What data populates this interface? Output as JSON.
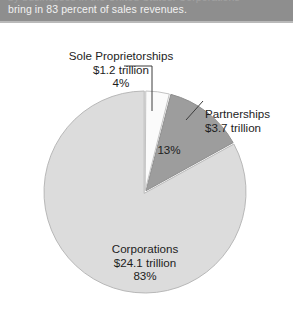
{
  "band": {
    "faint_line": "by businesses in the United States. Corporations",
    "main_line": "bring in 83 percent of sales revenues."
  },
  "chart_data": {
    "type": "pie",
    "title": "",
    "categories": [
      "Sole Proprietorships",
      "Partnerships",
      "Corporations"
    ],
    "values": [
      4,
      13,
      83
    ],
    "value_labels": [
      "$1.2 trillion",
      "$3.7 trillion",
      "$24.1 trillion"
    ],
    "percent_labels": [
      "4%",
      "13%",
      "83%"
    ],
    "units": "trillion dollars of sales revenues",
    "legend": "none",
    "start_angle_deg": 0,
    "direction": "clockwise",
    "slice_colors": [
      "#fbfbfb",
      "#9d9d9d",
      "#dcdcdc"
    ],
    "slice_stroke": "#b4b4b4",
    "grid": false
  },
  "labels": {
    "sole": {
      "name": "Sole Proprietorships",
      "amount": "$1.2 trillion",
      "percent": "4%"
    },
    "partnerships": {
      "name": "Partnerships",
      "amount": "$3.7 trillion",
      "percent": "13%"
    },
    "corporations": {
      "name": "Corporations",
      "amount": "$24.1 trillion",
      "percent": "83%"
    }
  },
  "colors": {
    "band_background": "#8e8e8e",
    "band_text": "#f2f2f2",
    "page_background": "#ffffff",
    "label_text": "#1d1d1d",
    "slice_sole": "#fbfbfb",
    "slice_partnerships": "#9d9d9d",
    "slice_corporations": "#dcdcdc",
    "leader_line": "#3c3c3c"
  }
}
